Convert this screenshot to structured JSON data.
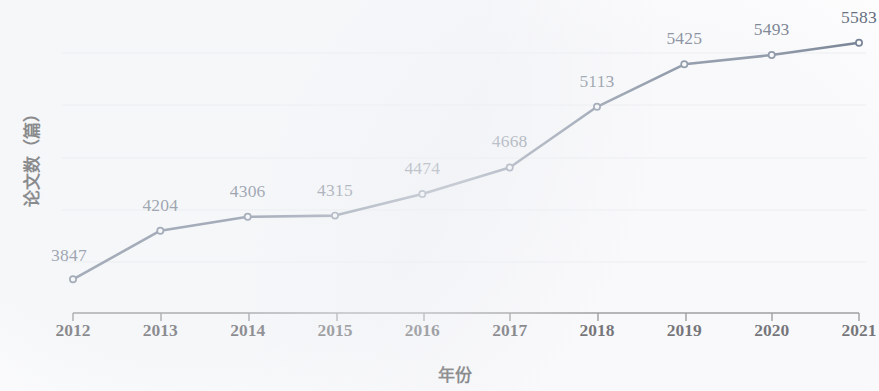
{
  "chart_data": {
    "type": "line",
    "title": "",
    "subtitle": "",
    "xlabel": "年份",
    "ylabel": "论文数（篇）",
    "categories": [
      "2012",
      "2013",
      "2014",
      "2015",
      "2016",
      "2017",
      "2018",
      "2019",
      "2020",
      "2021"
    ],
    "values": [
      3847,
      4204,
      4306,
      4315,
      4474,
      4668,
      5113,
      5425,
      5493,
      5583
    ],
    "series": [
      {
        "name": "论文数",
        "values": [
          3847,
          4204,
          4306,
          4315,
          4474,
          4668,
          5113,
          5425,
          5493,
          5583
        ]
      }
    ],
    "point_labels": [
      "3847",
      "4204",
      "4306",
      "4315",
      "4474",
      "4668",
      "5113",
      "5425",
      "5493",
      "5583"
    ],
    "ylim": [
      3600,
      5750
    ],
    "grid": "horizontal-faint",
    "legend": "none",
    "marker": "open-circle",
    "line_color": "#4a5a71",
    "label_color": "#3c4a5e",
    "axis_color": "#5a5a5a",
    "tick_label_color": "#111014",
    "axis_title_color": "#100f10",
    "background_color": "#ffffff"
  },
  "axes": {
    "x_ticks": [
      "2012",
      "2013",
      "2014",
      "2015",
      "2016",
      "2017",
      "2018",
      "2019",
      "2020",
      "2021"
    ],
    "x_title": "年份",
    "y_title": "论文数（篇）",
    "y_ticks": []
  }
}
